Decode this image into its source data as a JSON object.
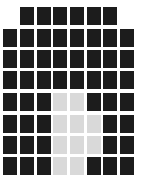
{
  "grid": {
    "columns": 8,
    "rows": 8,
    "col_x": [
      3,
      20,
      37,
      53,
      70,
      87,
      103,
      120
    ],
    "row_y": [
      7,
      29,
      50,
      71,
      93,
      115,
      136,
      157
    ],
    "colors": {
      "dark": "#1c1c1c",
      "light": "#d9d9d9",
      "background": "#ffffff"
    },
    "cells": [
      [
        "none",
        "dark",
        "dark",
        "dark",
        "dark",
        "dark",
        "dark",
        "none"
      ],
      [
        "dark",
        "dark",
        "dark",
        "dark",
        "dark",
        "dark",
        "dark",
        "dark"
      ],
      [
        "dark",
        "dark",
        "dark",
        "dark",
        "dark",
        "dark",
        "dark",
        "dark"
      ],
      [
        "dark",
        "dark",
        "dark",
        "dark",
        "dark",
        "dark",
        "dark",
        "dark"
      ],
      [
        "dark",
        "dark",
        "dark",
        "light",
        "light",
        "dark",
        "dark",
        "dark"
      ],
      [
        "dark",
        "dark",
        "dark",
        "light",
        "light",
        "light",
        "dark",
        "dark"
      ],
      [
        "dark",
        "dark",
        "dark",
        "light",
        "light",
        "light",
        "dark",
        "dark"
      ],
      [
        "dark",
        "dark",
        "dark",
        "light",
        "light",
        "dark",
        "dark",
        "dark"
      ]
    ]
  }
}
